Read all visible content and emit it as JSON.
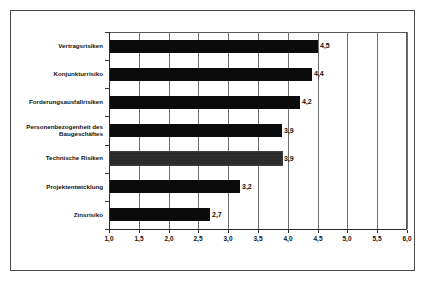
{
  "figure": {
    "frame_color": "#4a4a4a",
    "background": "#ffffff"
  },
  "chart_data": {
    "type": "bar",
    "orientation": "horizontal",
    "title": "",
    "subtitle": "",
    "xlabel": "",
    "ylabel": "",
    "xlim": [
      1.0,
      6.0
    ],
    "xticks": [
      1.0,
      1.5,
      2.0,
      2.5,
      3.0,
      3.5,
      4.0,
      4.5,
      5.0,
      5.5,
      6.0
    ],
    "xtick_labels": [
      "1,0",
      "1,5",
      "2,0",
      "2,5",
      "3,0",
      "3,5",
      "4,0",
      "4,5",
      "5,0",
      "5,5",
      "6,0"
    ],
    "grid": {
      "vertical": true,
      "horizontal": false,
      "color": "#6d7073"
    },
    "legend": {
      "visible": false,
      "position": "none"
    },
    "bar_color": "#0b0b0b",
    "highlight_color": "#1f1f1f",
    "categories": [
      "Vertragsrisiken",
      "Konjunkturrisiko",
      "Forderungsausfallrisiken",
      "Personenbezogenheit des\nBaugeschäftes",
      "Technische Risiken",
      "Projektentwicklung",
      "Zinsrisiko"
    ],
    "values": [
      4.5,
      4.4,
      4.2,
      3.9,
      3.9,
      3.2,
      2.7
    ],
    "value_labels": [
      "4,5",
      "4,4",
      "4,2",
      "3,9",
      "3,9",
      "3,2",
      "2,7"
    ],
    "highlighted_index": 4,
    "series": [
      {
        "name": "Risikobewertung",
        "values": [
          4.5,
          4.4,
          4.2,
          3.9,
          3.9,
          3.2,
          2.7
        ]
      }
    ]
  }
}
